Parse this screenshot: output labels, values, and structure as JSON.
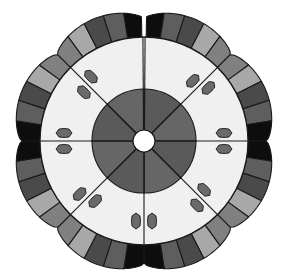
{
  "figure": {
    "center": [
      144,
      141
    ],
    "hole_radius": 11,
    "inner_circle_radius": 52,
    "light_ring_radius": 104,
    "band_outer_base": 122,
    "scallop_amplitude": 10,
    "sectors": 8,
    "slit": "top",
    "segments_per_sector": 5,
    "holly_pairs": 7
  },
  "colors": {
    "background": "#ffffff",
    "outline": "#1a1a1a",
    "center_dark": "#5a5a5a",
    "center_alt": "#666666",
    "light_ring": "#f0f0f0",
    "hole": "#ffffff",
    "holly": "#6a6a6a",
    "band_palette": [
      "#0d0d0d",
      "#5e5e5e",
      "#4a4a4a",
      "#a8a8a8",
      "#808080"
    ]
  },
  "band_sequence": [
    [
      "#0d0d0d",
      "#5e5e5e",
      "#4a4a4a",
      "#a8a8a8",
      "#808080"
    ],
    [
      "#0d0d0d",
      "#5e5e5e",
      "#4a4a4a",
      "#a8a8a8",
      "#808080"
    ],
    [
      "#0d0d0d",
      "#5e5e5e",
      "#4a4a4a",
      "#a8a8a8",
      "#808080"
    ],
    [
      "#0d0d0d",
      "#5e5e5e",
      "#4a4a4a",
      "#a8a8a8",
      "#808080"
    ],
    [
      "#0d0d0d",
      "#5e5e5e",
      "#4a4a4a",
      "#a8a8a8",
      "#808080"
    ],
    [
      "#0d0d0d",
      "#5e5e5e",
      "#4a4a4a",
      "#a8a8a8",
      "#808080"
    ],
    [
      "#0d0d0d",
      "#5e5e5e",
      "#4a4a4a",
      "#a8a8a8",
      "#808080"
    ],
    [
      "#0d0d0d",
      "#5e5e5e",
      "#4a4a4a",
      "#a8a8a8",
      "#808080"
    ]
  ]
}
